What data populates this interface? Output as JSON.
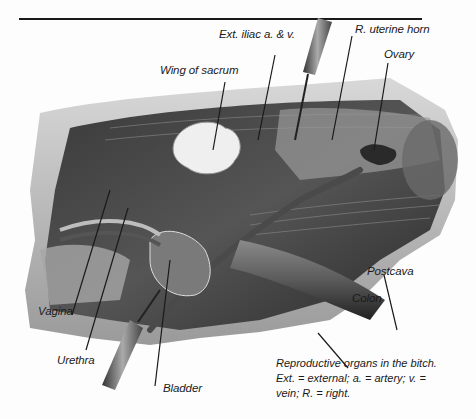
{
  "figure": {
    "title": "Reproductive organs in the bitch",
    "labels": {
      "ext_iliac": "Ext. iliac a. & v.",
      "r_uterine_horn": "R. uterine horn",
      "wing_of_sacrum": "Wing of sacrum",
      "ovary": "Ovary",
      "postcava": "Postcava",
      "colon": "Colon",
      "vagina": "Vagina",
      "urethra": "Urethra",
      "bladder": "Bladder"
    },
    "caption": {
      "line1": "Reproductive organs in the bitch.",
      "line2": "Ext. = external; a. = artery; v. =",
      "line3": "vein; R. = right."
    },
    "colors": {
      "ink": "#1a1a1a",
      "tissue_dark": "#2a2a2a",
      "tissue_mid": "#6e6e6e",
      "tissue_light": "#bdbdbd",
      "bone": "#efefef"
    }
  }
}
